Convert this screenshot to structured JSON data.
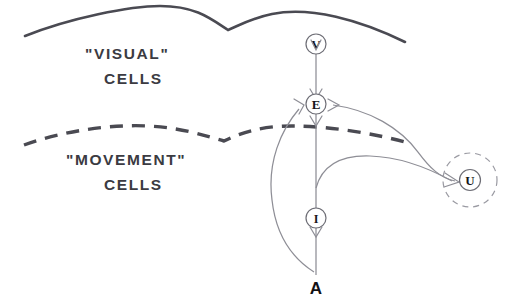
{
  "figure": {
    "background_color": "#ffffff",
    "width": 519,
    "height": 305
  },
  "labels": {
    "visual": {
      "line1": "\"VISUAL\"",
      "line2": "CELLS"
    },
    "movement": {
      "line1": "\"MOVEMENT\"",
      "line2": "CELLS"
    }
  },
  "boundaries": [
    {
      "name": "visual-layer-boundary",
      "style": "solid",
      "color": "#4a4a52"
    },
    {
      "name": "movement-layer-boundary",
      "style": "dashed",
      "color": "#4a4a52"
    }
  ],
  "nodes": [
    {
      "id": "V",
      "label": "V",
      "shape": "circle",
      "halo": false
    },
    {
      "id": "E",
      "label": "E",
      "shape": "circle",
      "halo": false
    },
    {
      "id": "I",
      "label": "I",
      "shape": "circle",
      "halo": false
    },
    {
      "id": "U",
      "label": "U",
      "shape": "circle",
      "halo": true
    },
    {
      "id": "A",
      "label": "A",
      "shape": "text",
      "halo": false
    }
  ],
  "connections": [
    {
      "from": "V",
      "to": "E",
      "style": "straight",
      "arrow": true
    },
    {
      "from": "E",
      "to": "I",
      "style": "straight",
      "arrow": true
    },
    {
      "from": "I",
      "to": "A",
      "style": "straight",
      "arrow": true
    },
    {
      "from": "A",
      "to": "E",
      "style": "curve-left",
      "arrow": true
    },
    {
      "from": "E",
      "to": "U",
      "style": "curve-upper",
      "arrow": true
    },
    {
      "from": "I",
      "to": "U",
      "style": "curve-lower",
      "arrow": true
    }
  ],
  "colors": {
    "boundary": "#4a4a52",
    "connection": "#8e8e96",
    "node_stroke": "#6e6e76",
    "text": "#3b3b42",
    "halo": "#9a9aa2"
  }
}
